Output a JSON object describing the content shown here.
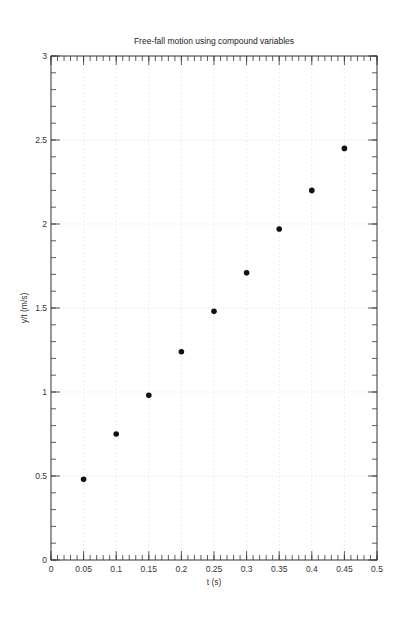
{
  "chart_data": {
    "type": "scatter",
    "title": "Free-fall motion using compound variables",
    "xlabel": "t (s)",
    "ylabel": "y/t (m/s)",
    "xlim": [
      0,
      0.5
    ],
    "ylim": [
      0,
      3
    ],
    "grid": true,
    "legend": null,
    "x_ticks": [
      0,
      0.05,
      0.1,
      0.15,
      0.2,
      0.25,
      0.3,
      0.35,
      0.4,
      0.45,
      0.5
    ],
    "x_tick_labels": [
      "0",
      "0.05",
      "0.1",
      "0.15",
      "0.2",
      "0.25",
      "0.3",
      "0.35",
      "0.4",
      "0.45",
      "0.5"
    ],
    "y_ticks": [
      0,
      0.5,
      1,
      1.5,
      2,
      2.5,
      3
    ],
    "y_tick_labels": [
      "0",
      "0.5",
      "1",
      "1.5",
      "2",
      "2.5",
      "3"
    ],
    "x_minor_step": 0.01,
    "y_minor_step": 0.1,
    "series": [
      {
        "name": "y/t",
        "marker": "filled-circle",
        "color": "#111111",
        "x": [
          0.05,
          0.1,
          0.15,
          0.2,
          0.25,
          0.3,
          0.35,
          0.4,
          0.45
        ],
        "y": [
          0.48,
          0.75,
          0.98,
          1.24,
          1.48,
          1.71,
          1.97,
          2.2,
          2.45
        ]
      }
    ]
  }
}
